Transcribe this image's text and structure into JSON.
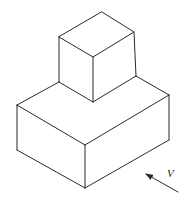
{
  "figure": {
    "type": "isometric-drawing",
    "colors": {
      "line": "#2b2b2b",
      "background": "#ffffff"
    },
    "view_label": "V"
  },
  "shapes": {
    "small_cube": {
      "vertices": {
        "top_back": [
          102,
          12
        ],
        "top_left": [
          59,
          37
        ],
        "top_right": [
          134,
          32
        ],
        "top_front": [
          93,
          57
        ],
        "bottom_left": [
          59,
          82
        ],
        "bottom_right": [
          136,
          76
        ],
        "bottom_front": [
          93,
          102
        ]
      }
    },
    "big_box": {
      "vertices": {
        "top_left": [
          17,
          105
        ],
        "top_right": [
          169,
          95
        ],
        "top_front": [
          85,
          145
        ],
        "bottom_left": [
          17,
          150
        ],
        "bottom_right": [
          169,
          140
        ],
        "bottom_front": [
          85,
          188
        ]
      }
    }
  },
  "view_arrow": {
    "tail": [
      178,
      192
    ],
    "tip": [
      145,
      173
    ],
    "label": "V",
    "label_pos": [
      168,
      177
    ]
  }
}
